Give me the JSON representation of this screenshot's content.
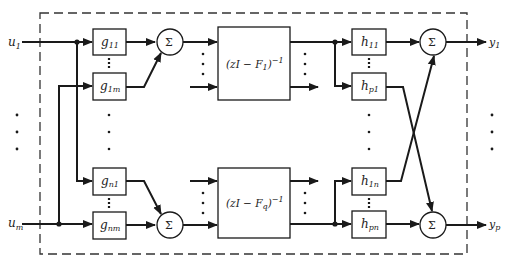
{
  "diagram": {
    "inputs": [
      {
        "label": "u",
        "sub": "1"
      },
      {
        "label": "u",
        "sub": "m"
      }
    ],
    "outputs": [
      {
        "label": "y",
        "sub": "1"
      },
      {
        "label": "y",
        "sub": "p"
      }
    ],
    "g_blocks": [
      {
        "label": "g",
        "sub": "11"
      },
      {
        "label": "g",
        "sub": "1m"
      },
      {
        "label": "g",
        "sub": "n1"
      },
      {
        "label": "g",
        "sub": "nm"
      }
    ],
    "state_blocks": [
      {
        "text_pre": "(zI  −  F",
        "sub": "1",
        "text_post": ")",
        "sup": "−1"
      },
      {
        "text_pre": "(zI  −  F",
        "sub": "q",
        "text_post": ")",
        "sup": "−1"
      }
    ],
    "h_blocks": [
      {
        "label": "h",
        "sub": "11"
      },
      {
        "label": "h",
        "sub": "p1"
      },
      {
        "label": "h",
        "sub": "1n"
      },
      {
        "label": "h",
        "sub": "pn"
      }
    ],
    "summer_symbol": "Σ"
  }
}
